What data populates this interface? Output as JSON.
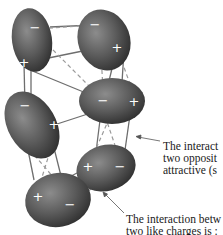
{
  "diagram": {
    "molecules": [
      {
        "id": 1,
        "neg": "−",
        "pos": "+"
      },
      {
        "id": 2,
        "neg": "−",
        "pos": "+"
      },
      {
        "id": 3,
        "neg": "−",
        "pos": "+"
      },
      {
        "id": 4,
        "neg": "−",
        "pos": "+"
      },
      {
        "id": 5,
        "neg": "−",
        "pos": "+"
      },
      {
        "id": 6,
        "neg": "−",
        "pos": "+"
      }
    ],
    "annotations": {
      "attractive": {
        "line1": "The interact",
        "line2": "two opposit",
        "line3": "attractive (s"
      },
      "repulsive": {
        "line1": "The interaction betw",
        "line2": "two like charges is :"
      }
    },
    "colors": {
      "molecule_dark": "#3a3a3a",
      "molecule_light": "#8a8a8a",
      "solid_line": "#6e6e6e",
      "dashed_line": "#9a9a9a",
      "charge_symbol": "#ffffff"
    }
  }
}
